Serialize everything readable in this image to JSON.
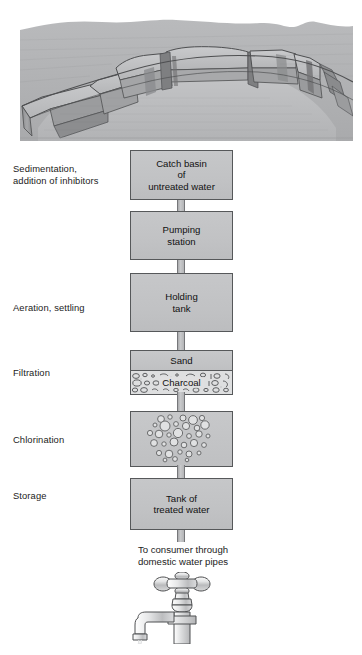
{
  "figure": {
    "illustration_top": "reservoir-landscape-illustration",
    "illustration_bottom": "faucet-illustration"
  },
  "colors": {
    "box_fill": "#c3c4c6",
    "box_border": "#56585a",
    "pipe_fill": "#bcbdbf",
    "charcoal_fill": "#dcdcdd",
    "text": "#1a1a1a",
    "page_background": "#ffffff"
  },
  "stages": [
    {
      "label": "Sedimentation,\naddition of inhibitors",
      "label_line1": "Sedimentation,",
      "label_line2": "addition of inhibitors"
    },
    {
      "label": "Aeration, settling",
      "label_line1": "Aeration, settling",
      "label_line2": ""
    },
    {
      "label": "Filtration",
      "label_line1": "Filtration",
      "label_line2": ""
    },
    {
      "label": "Chlorination",
      "label_line1": "Chlorination",
      "label_line2": ""
    },
    {
      "label": "Storage",
      "label_line1": "Storage",
      "label_line2": ""
    }
  ],
  "boxes": {
    "catch_basin": {
      "line1": "Catch basin",
      "line2": "of",
      "line3": "untreated water"
    },
    "pumping_station": {
      "line1": "Pumping",
      "line2": "station"
    },
    "holding_tank": {
      "line1": "Holding",
      "line2": "tank"
    },
    "sand": {
      "line1": "Sand"
    },
    "charcoal": {
      "line1": "Charcoal"
    },
    "chlorination": {
      "line1": ""
    },
    "treated_tank": {
      "line1": "Tank of",
      "line2": "treated water"
    }
  },
  "outflow": {
    "line1": "To consumer through",
    "line2": "domestic water pipes"
  },
  "bottom_caption": {
    "text": ""
  }
}
